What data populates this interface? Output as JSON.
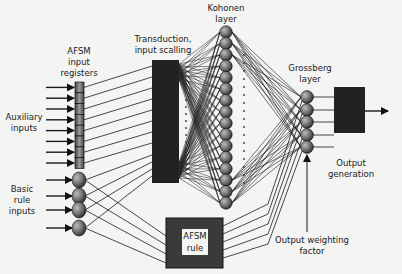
{
  "diagram": {
    "labels": {
      "afsm_input_registers": [
        "AFSM",
        "input",
        "registers"
      ],
      "transduction": [
        "Transduction,",
        "input scalling"
      ],
      "kohonen": [
        "Kohonen",
        "layer"
      ],
      "grossberg": [
        "Grossberg",
        "layer"
      ],
      "auxiliary_inputs": [
        "Auxiliary",
        "inputs"
      ],
      "basic_rule_inputs": [
        "Basic",
        "rule",
        "inputs"
      ],
      "output_generation": [
        "Output",
        "generation"
      ],
      "afsm_rule": [
        "AFSM",
        "rule"
      ],
      "output_weighting": [
        "Output weighting",
        "factor"
      ]
    },
    "counts": {
      "auxiliary_inputs": 8,
      "basic_rule_inputs": 4,
      "kohonen_nodes": 16,
      "grossberg_nodes": 5,
      "output_lines": 5
    },
    "colors": {
      "line": "#1a1a1a",
      "box": "#222222",
      "node": "#555555",
      "background": "#f4f4f2"
    }
  }
}
